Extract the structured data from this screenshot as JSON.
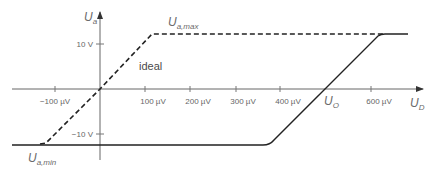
{
  "diagram": {
    "type": "op-amp transfer characteristic",
    "y_axis": {
      "symbol": "U",
      "subscript": "a"
    },
    "x_axis": {
      "symbol": "U",
      "subscript": "D"
    },
    "y_ticks": [
      {
        "label": "10 V",
        "value": 10
      },
      {
        "label": "−10 V",
        "value": -10
      }
    ],
    "x_ticks": [
      {
        "label": "−100 µV",
        "value": -100
      },
      {
        "label": "100 µV",
        "value": 100
      },
      {
        "label": "200 µV",
        "value": 200
      },
      {
        "label": "300 µV",
        "value": 300
      },
      {
        "label": "400 µV",
        "value": 400
      },
      {
        "label": "600 µV",
        "value": 600
      }
    ],
    "annotations": {
      "ua_max": {
        "symbol": "U",
        "subscript": "a,max"
      },
      "ua_min": {
        "symbol": "U",
        "subscript": "a,min"
      },
      "offset": {
        "symbol": "U",
        "subscript": "O"
      },
      "ideal": "ideal"
    },
    "curves": [
      {
        "name": "ideal",
        "style": "dashed",
        "color": "#222222"
      },
      {
        "name": "real (with offset)",
        "style": "solid",
        "color": "#222222"
      }
    ],
    "colors": {
      "axis": "#555555",
      "curve": "#222222",
      "text": "#666666"
    }
  }
}
